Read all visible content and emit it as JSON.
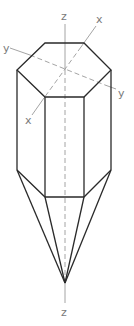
{
  "figure": {
    "axis_labels": {
      "z_top": "z",
      "z_bottom": "z",
      "x_top": "x",
      "x_bottom": "x",
      "y_left": "y",
      "y_right": "y"
    },
    "colors": {
      "edges": "#2a2a2a",
      "axes": "#9a9a9a",
      "labels": "#7a7a7a",
      "background": "#ffffff"
    }
  }
}
